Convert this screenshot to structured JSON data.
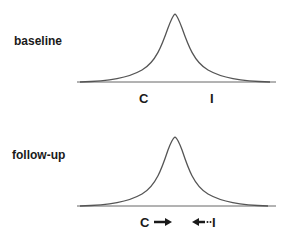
{
  "panels": [
    {
      "label": "baseline",
      "axis_labels": {
        "left": "C",
        "right": "I"
      },
      "arrows": null
    },
    {
      "label": "follow-up",
      "axis_labels": {
        "left": "C",
        "right": "I"
      },
      "arrows": {
        "left": "→",
        "right": "←···"
      }
    }
  ],
  "colors": {
    "line": "#555555",
    "text": "#1a1a1a",
    "background": "#ffffff"
  }
}
